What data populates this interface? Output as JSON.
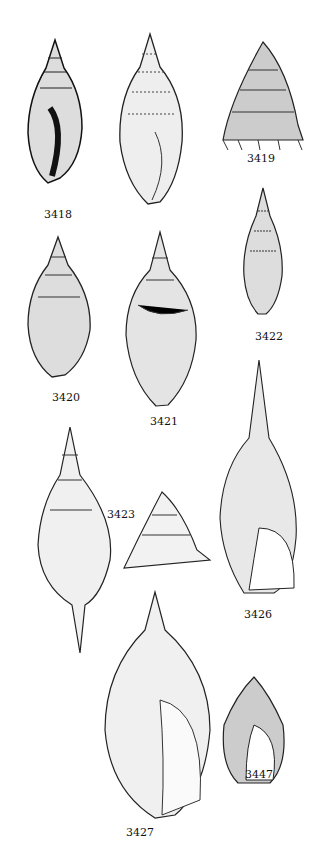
{
  "plate": {
    "background": "#ffffff",
    "ink": "#1a1a1a",
    "figures": [
      {
        "id": "3418",
        "label": "3418"
      },
      {
        "id": "3419",
        "label": "3419"
      },
      {
        "id": "3420",
        "label": "3420"
      },
      {
        "id": "3421",
        "label": "3421"
      },
      {
        "id": "3422",
        "label": "3422"
      },
      {
        "id": "3423",
        "label": "3423"
      },
      {
        "id": "3426",
        "label": "3426"
      },
      {
        "id": "3427",
        "label": "3427"
      },
      {
        "id": "3447",
        "label": "3447"
      }
    ]
  }
}
